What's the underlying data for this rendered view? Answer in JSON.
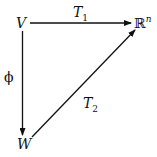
{
  "diagram": {
    "type": "commutative-diagram",
    "nodes": {
      "V": {
        "label": "V"
      },
      "R": {
        "label": "ℝ",
        "sup": "n"
      },
      "W": {
        "label": "W"
      }
    },
    "edges": [
      {
        "from": "V",
        "to": "ℝⁿ",
        "label": "T",
        "sub": "1"
      },
      {
        "from": "V",
        "to": "W",
        "label": "ϕ"
      },
      {
        "from": "W",
        "to": "ℝⁿ",
        "label": "T",
        "sub": "2"
      }
    ]
  }
}
